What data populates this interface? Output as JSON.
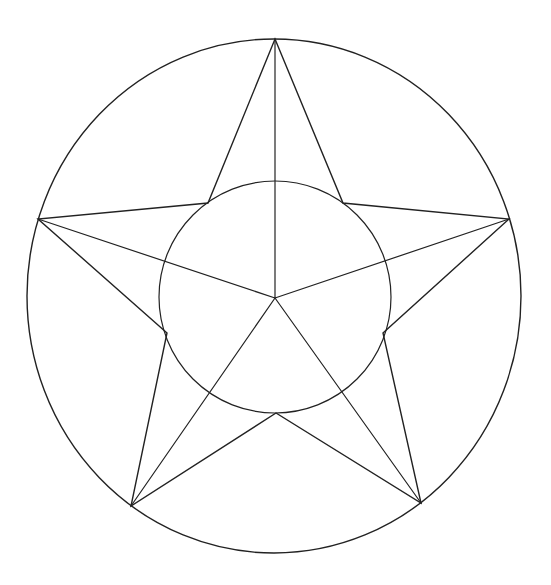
{
  "header": {
    "clipped_title_fragment": "▁▁▁ ▁▁▁▁▁▁▁▁▁"
  },
  "figure": {
    "stroke_color": "#222222",
    "background_color": "#ffffff",
    "outer_circle": {
      "cx": 274,
      "cy": 296,
      "rx": 247,
      "ry": 257
    },
    "inner_circle": {
      "cx": 275,
      "cy": 297,
      "r": 116
    },
    "center": {
      "x": 275,
      "y": 298
    },
    "outer_vertices": [
      {
        "name": "top",
        "x": 275,
        "y": 39
      },
      {
        "name": "right",
        "x": 509,
        "y": 219
      },
      {
        "name": "bottom-right",
        "x": 421,
        "y": 503
      },
      {
        "name": "bottom-left",
        "x": 131,
        "y": 506
      },
      {
        "name": "left",
        "x": 38,
        "y": 219
      }
    ],
    "inner_vertices": [
      {
        "name": "upper-right",
        "x": 343,
        "y": 203
      },
      {
        "name": "lower-right",
        "x": 383,
        "y": 333
      },
      {
        "name": "bottom",
        "x": 276,
        "y": 413
      },
      {
        "name": "lower-left",
        "x": 167,
        "y": 333
      },
      {
        "name": "upper-left",
        "x": 208,
        "y": 203
      }
    ]
  }
}
